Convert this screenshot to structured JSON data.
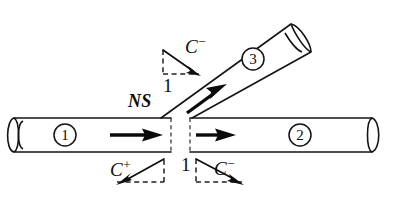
{
  "figure": {
    "background_color": "#ffffff",
    "line_color": "#141414",
    "dash_color": "#3a3a3a"
  },
  "labels": {
    "ns": "NS",
    "branch_characteristic": "C",
    "branch_characteristic_sign": "−",
    "branch_slope": "1",
    "junction_slope": "1",
    "upstream_characteristic": "C",
    "upstream_characteristic_sign": "+",
    "downstream_characteristic": "C",
    "downstream_characteristic_sign": "−"
  },
  "pipes": [
    {
      "id": "1",
      "number": "1",
      "name": "upstream-pipe",
      "direction": "horizontal-right"
    },
    {
      "id": "2",
      "number": "2",
      "name": "downstream-pipe",
      "direction": "horizontal-right"
    },
    {
      "id": "3",
      "number": "3",
      "name": "branch-pipe",
      "direction": "diagonal-up-right"
    }
  ],
  "flow_arrows": [
    {
      "name": "flow-arrow-pipe-1",
      "pipe": "1",
      "direction": "right"
    },
    {
      "name": "flow-arrow-pipe-2",
      "pipe": "2",
      "direction": "right"
    },
    {
      "name": "flow-arrow-pipe-3",
      "pipe": "3",
      "direction": "up-right"
    }
  ],
  "characteristic_triangles": [
    {
      "name": "branch-c-minus-triangle",
      "label": "C−",
      "slope_label": "1",
      "slope_sign": "negative"
    },
    {
      "name": "upstream-c-plus-triangle",
      "label": "C+",
      "slope_label": "",
      "slope_sign": "positive"
    },
    {
      "name": "downstream-c-minus-triangle",
      "label": "C−",
      "slope_label": "1",
      "slope_sign": "negative"
    }
  ]
}
